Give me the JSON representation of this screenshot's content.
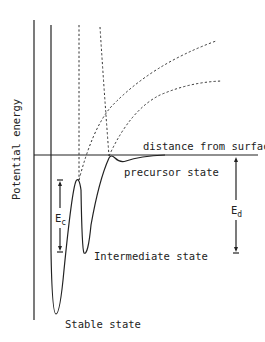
{
  "diagram": {
    "type": "potential-energy-diagram",
    "y_axis_label": "Potential energy",
    "x_axis_label": "distance from surface",
    "labels": {
      "precursor": "precursor state",
      "intermediate": "Intermediate state",
      "stable": "Stable state"
    },
    "energies": {
      "ec_main": "E",
      "ec_sub": "c",
      "ed_main": "E",
      "ed_sub": "d"
    },
    "colors": {
      "line": "#222222",
      "background": "#ffffff"
    }
  }
}
